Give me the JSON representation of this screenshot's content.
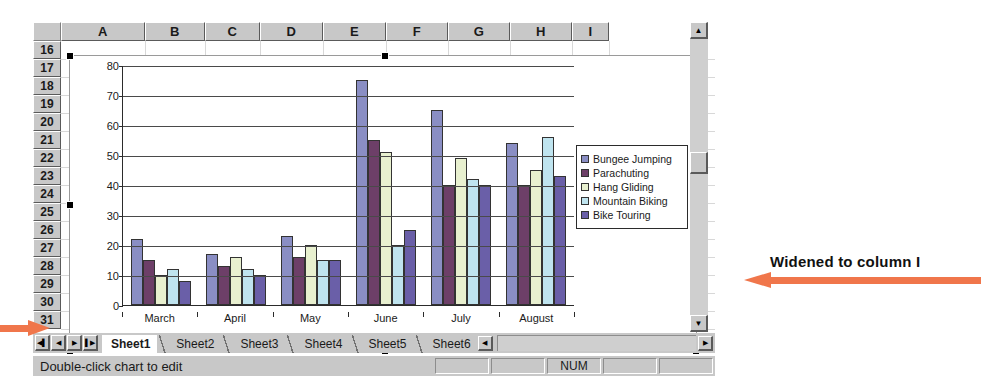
{
  "spreadsheet": {
    "column_headers": [
      "A",
      "B",
      "C",
      "D",
      "E",
      "F",
      "G",
      "H",
      "I"
    ],
    "row_headers": [
      "16",
      "17",
      "18",
      "19",
      "20",
      "21",
      "22",
      "23",
      "24",
      "25",
      "26",
      "27",
      "28",
      "29",
      "30",
      "31"
    ],
    "sheet_tabs": [
      {
        "label": "Sheet1",
        "active": true
      },
      {
        "label": "Sheet2",
        "active": false
      },
      {
        "label": "Sheet3",
        "active": false
      },
      {
        "label": "Sheet4",
        "active": false
      },
      {
        "label": "Sheet5",
        "active": false
      },
      {
        "label": "Sheet6",
        "active": false
      }
    ],
    "tab_nav": {
      "first": "◀▌",
      "prev": "◀",
      "next": "▶",
      "last": "▌▶"
    },
    "scroll": {
      "up_arrow": "▲",
      "down_arrow": "▼",
      "left_arrow": "◀",
      "right_arrow": "▶"
    },
    "status": {
      "message": "Double-click chart to edit",
      "num_indicator": "NUM"
    }
  },
  "annotations": [
    {
      "id": "widened",
      "text": "Widened to column I"
    }
  ],
  "chart_data": {
    "type": "bar",
    "title": "",
    "xlabel": "",
    "ylabel": "",
    "ylim": [
      0,
      80
    ],
    "yticks": [
      0,
      10,
      20,
      30,
      40,
      50,
      60,
      70,
      80
    ],
    "grid": true,
    "legend_position": "right",
    "categories": [
      "March",
      "April",
      "May",
      "June",
      "July",
      "August"
    ],
    "series": [
      {
        "name": "Bungee Jumping",
        "color": "#8a8ec4",
        "values": [
          22,
          17,
          23,
          75,
          65,
          54
        ]
      },
      {
        "name": "Parachuting",
        "color": "#6d3f68",
        "values": [
          15,
          13,
          16,
          55,
          40,
          40
        ]
      },
      {
        "name": "Hang Gliding",
        "color": "#e8f0cf",
        "values": [
          10,
          16,
          20,
          51,
          49,
          45
        ]
      },
      {
        "name": "Mountain Biking",
        "color": "#bfe4ef",
        "values": [
          12,
          12,
          15,
          20,
          42,
          56
        ]
      },
      {
        "name": "Bike Touring",
        "color": "#6a5fa8",
        "values": [
          8,
          10,
          15,
          25,
          40,
          43
        ]
      }
    ]
  }
}
